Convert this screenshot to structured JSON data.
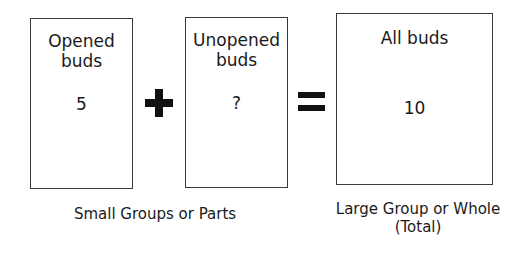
{
  "boxes": [
    {
      "label": "Opened buds",
      "value": "5"
    },
    {
      "label": "Unopened buds",
      "value": "?"
    },
    {
      "label": "All buds",
      "value": "10"
    }
  ],
  "operators": {
    "plus": "plus-icon",
    "equals": "equals-icon"
  },
  "captions": {
    "parts": "Small Groups or Parts",
    "whole_line1": "Large Group or Whole",
    "whole_line2": "(Total)"
  }
}
